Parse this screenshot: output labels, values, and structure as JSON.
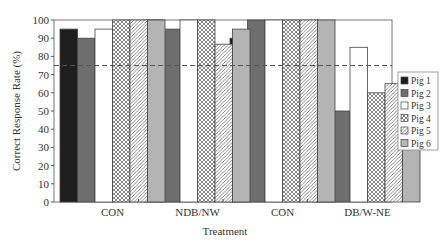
{
  "chart_data": {
    "type": "bar",
    "title": "",
    "xlabel": "Treatment",
    "ylabel": "Correct Response Rate (%)",
    "ylim": [
      0,
      100
    ],
    "yticks": [
      0,
      10,
      20,
      30,
      40,
      50,
      60,
      70,
      80,
      90,
      100
    ],
    "grid": false,
    "legend_position": "right",
    "reference_line": {
      "value": 75,
      "style": "dashed"
    },
    "categories": [
      "CON",
      "NDB/NW",
      "CON",
      "DB/W-NE"
    ],
    "series": [
      {
        "name": "Pig 1",
        "values": [
          95,
          100,
          90,
          70
        ],
        "fill": "#1e1e1e",
        "pattern": "solid"
      },
      {
        "name": "Pig 2",
        "values": [
          90,
          95,
          100,
          50
        ],
        "fill": "#6e6e6e",
        "pattern": "solid"
      },
      {
        "name": "Pig 3",
        "values": [
          95,
          100,
          100,
          85
        ],
        "fill": "#ffffff",
        "pattern": "solid"
      },
      {
        "name": "Pig 4",
        "values": [
          100,
          100,
          100,
          60
        ],
        "fill": "#ffffff",
        "pattern": "crosshatch"
      },
      {
        "name": "Pig 5",
        "values": [
          100,
          86.7,
          100,
          65
        ],
        "fill": "#ffffff",
        "pattern": "diagonal"
      },
      {
        "name": "Pig 6",
        "values": [
          100,
          95,
          100,
          60
        ],
        "fill": "#b4b4b4",
        "pattern": "solid"
      }
    ]
  }
}
